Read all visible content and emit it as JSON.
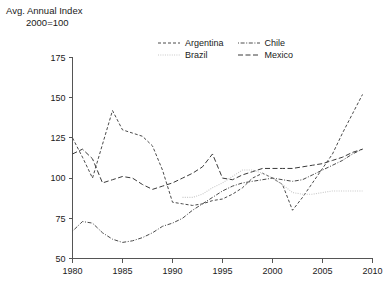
{
  "header": {
    "title_line1": "Avg. Annual Index",
    "title_line2": "2000=100"
  },
  "legend": {
    "position": "top-right-inside",
    "entries": [
      {
        "label": "Argentina",
        "dash": "3,2",
        "color": "#4a4a4a",
        "width": 1
      },
      {
        "label": "Chile",
        "dash": "1,1.6,4,1.6",
        "color": "#4a4a4a",
        "width": 1
      },
      {
        "label": "Brazil",
        "dash": "1,1.3",
        "color": "#c8c8c8",
        "width": 1.1
      },
      {
        "label": "Mexico",
        "dash": "5,2.5",
        "color": "#3a3a3a",
        "width": 1
      }
    ]
  },
  "chart_data": {
    "type": "line",
    "title": "Avg. Annual Index",
    "subtitle": "2000=100",
    "xlabel": "",
    "ylabel": "Avg. Annual Index (2000=100)",
    "xlim": [
      1980,
      2010
    ],
    "ylim": [
      50,
      175
    ],
    "xticks": [
      1980,
      1985,
      1990,
      1995,
      2000,
      2005,
      2010
    ],
    "yticks": [
      50,
      75,
      100,
      125,
      150,
      175
    ],
    "grid": false,
    "series": [
      {
        "name": "Argentina",
        "x": [
          1980,
          1981,
          1982,
          1983,
          1984,
          1985,
          1986,
          1987,
          1988,
          1989,
          1990,
          1991,
          1992,
          1993,
          1994,
          1995,
          1996,
          1997,
          1998,
          1999,
          2000,
          2001,
          2002,
          2003,
          2004,
          2005,
          2006,
          2007,
          2008,
          2009
        ],
        "values": [
          125,
          113,
          100,
          121,
          142,
          130,
          128,
          126,
          120,
          105,
          85,
          84,
          83,
          84,
          86,
          87,
          90,
          94,
          100,
          103,
          100,
          96,
          80,
          88,
          97,
          106,
          115,
          128,
          140,
          152
        ]
      },
      {
        "name": "Brazil",
        "x": [
          1991,
          1992,
          1993,
          1994,
          1995,
          1996,
          1997,
          1998,
          1999,
          2000,
          2001,
          2002,
          2003,
          2004,
          2005,
          2006,
          2007,
          2008,
          2009
        ],
        "values": [
          88,
          88,
          90,
          94,
          97,
          101,
          105,
          105,
          103,
          100,
          96,
          91,
          90,
          90,
          91,
          92,
          92,
          92,
          92
        ]
      },
      {
        "name": "Chile",
        "x": [
          1980,
          1981,
          1982,
          1983,
          1984,
          1985,
          1986,
          1987,
          1988,
          1989,
          1990,
          1991,
          1992,
          1993,
          1994,
          1995,
          1996,
          1997,
          1998,
          1999,
          2000,
          2001,
          2002,
          2003,
          2004,
          2005,
          2006,
          2007,
          2008,
          2009
        ],
        "values": [
          67,
          73,
          72,
          66,
          62,
          60,
          61,
          63,
          66,
          70,
          72,
          75,
          80,
          84,
          88,
          92,
          95,
          97,
          98,
          99,
          100,
          99,
          98,
          99,
          102,
          105,
          108,
          111,
          115,
          118
        ]
      },
      {
        "name": "Mexico",
        "x": [
          1980,
          1981,
          1982,
          1983,
          1984,
          1985,
          1986,
          1987,
          1988,
          1989,
          1990,
          1991,
          1992,
          1993,
          1994,
          1995,
          1996,
          1997,
          1998,
          1999,
          2000,
          2001,
          2002,
          2003,
          2004,
          2005,
          2006,
          2007,
          2008,
          2009
        ],
        "values": [
          115,
          118,
          112,
          97,
          99,
          101,
          100,
          96,
          93,
          95,
          97,
          100,
          103,
          107,
          115,
          100,
          99,
          102,
          104,
          106,
          106,
          106,
          106,
          107,
          108,
          109,
          111,
          113,
          116,
          118
        ]
      }
    ]
  },
  "axes": {
    "y_tick_labels": [
      "175",
      "150",
      "125",
      "100",
      "75",
      "50"
    ],
    "x_tick_labels": [
      "1980",
      "1985",
      "1990",
      "1995",
      "2000",
      "2005",
      "2010"
    ]
  }
}
